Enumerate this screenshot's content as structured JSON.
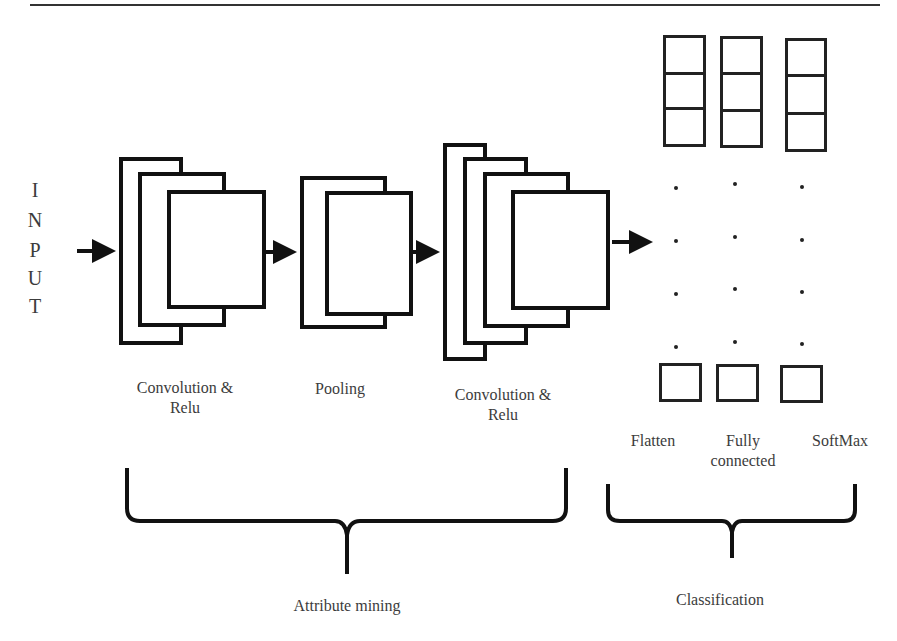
{
  "input_label": [
    "I",
    "N",
    "P",
    "U",
    "T"
  ],
  "stages": {
    "conv1": {
      "label_line1": "Convolution &",
      "label_line2": "Relu"
    },
    "pool": {
      "label_line1": "Pooling"
    },
    "conv2": {
      "label_line1": "Convolution &",
      "label_line2": "Relu"
    },
    "flatten": {
      "label_line1": "Flatten"
    },
    "fully_connected": {
      "label_line1": "Fully",
      "label_line2": "connected"
    },
    "softmax": {
      "label_line1": "SoftMax"
    }
  },
  "groups": {
    "attribute_mining": "Attribute mining",
    "classification": "Classification"
  },
  "icons": {
    "arrow": "right-arrow",
    "brace": "curly-brace-down",
    "ellipsis": "vertical-dots"
  },
  "colors": {
    "stroke": "#111111",
    "text": "#3c3c3c",
    "background": "#ffffff"
  }
}
